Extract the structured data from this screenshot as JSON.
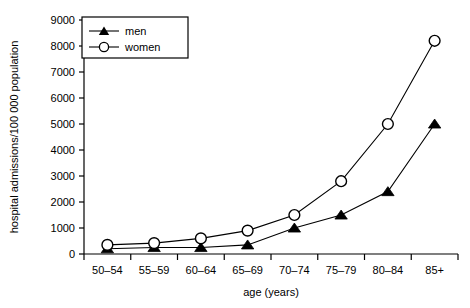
{
  "chart_data": {
    "type": "line",
    "title": "",
    "xlabel": "age (years)",
    "ylabel": "hospital admissions/100 000 population",
    "categories": [
      "50–54",
      "55–59",
      "60–64",
      "65–69",
      "70–74",
      "75–79",
      "80–84",
      "85+"
    ],
    "yticks": [
      0,
      1000,
      2000,
      3000,
      4000,
      5000,
      6000,
      7000,
      8000,
      9000
    ],
    "ylim": [
      0,
      9000
    ],
    "grid": false,
    "legend_position": "top-left",
    "series": [
      {
        "name": "men",
        "marker": "filled-triangle",
        "color": "#000000",
        "values": [
          200,
          250,
          250,
          350,
          1000,
          1500,
          2400,
          5000
        ]
      },
      {
        "name": "women",
        "marker": "open-circle",
        "color": "#000000",
        "values": [
          350,
          420,
          600,
          900,
          1500,
          2800,
          5000,
          8200
        ]
      }
    ]
  },
  "legend": {
    "entries": [
      {
        "label": "men"
      },
      {
        "label": "women"
      }
    ]
  },
  "axis": {
    "y_title": "hospital admissions/100 000 population",
    "x_title": "age (years)"
  }
}
